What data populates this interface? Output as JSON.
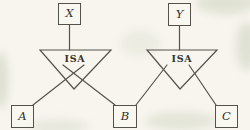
{
  "diagram": {
    "type": "er-isa-hierarchy",
    "labels": {
      "x": "X",
      "y": "Y",
      "a": "A",
      "b": "B",
      "c": "C",
      "isa_left": "ISA",
      "isa_right": "ISA"
    },
    "relationships": [
      {
        "label": "ISA",
        "parent": "X",
        "children": [
          "A",
          "B"
        ]
      },
      {
        "label": "ISA",
        "parent": "Y",
        "children": [
          "B",
          "C"
        ]
      }
    ],
    "colors": {
      "paper": "#f7f5ee",
      "ink": "#49463e",
      "stain": "#cdd4be"
    }
  }
}
